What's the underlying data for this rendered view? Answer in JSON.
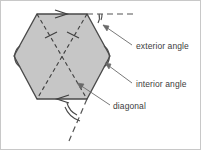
{
  "figure": {
    "shape": {
      "name": "regular hexagon",
      "sides": 6,
      "fill_color": "#c6c6c6",
      "stroke_color": "#4a4a4a",
      "vertices": [
        {
          "id": "top-left",
          "x": 37,
          "y": 14
        },
        {
          "id": "top-right",
          "x": 87,
          "y": 14
        },
        {
          "id": "right",
          "x": 110,
          "y": 56
        },
        {
          "id": "bottom-right",
          "x": 87,
          "y": 99
        },
        {
          "id": "bottom-left",
          "x": 37,
          "y": 99
        },
        {
          "id": "left",
          "x": 14,
          "y": 56
        }
      ]
    },
    "diagonals": [
      {
        "id": "diagonal-tl-br",
        "from": "top-left",
        "to": "bottom-right",
        "tick_marks": 1,
        "style": "dashed"
      },
      {
        "id": "diagonal-tr-bl",
        "from": "top-right",
        "to": "bottom-left",
        "tick_marks": 1,
        "style": "dashed"
      }
    ],
    "extension_lines": [
      {
        "id": "extension-top",
        "from": "top-right",
        "direction": "right",
        "style": "dashed"
      },
      {
        "id": "extension-bottom",
        "from": "bottom-right",
        "direction": "down-right",
        "style": "dashed"
      }
    ],
    "direction_arrows": [
      {
        "id": "arrow-top-edge",
        "edge": "top",
        "points": "right"
      },
      {
        "id": "arrow-bottom-edge",
        "edge": "bottom",
        "points": "left"
      }
    ],
    "angle_markers": [
      {
        "id": "exterior-angle-top",
        "vertex": "top-right",
        "arcs": 2,
        "type": "exterior"
      },
      {
        "id": "exterior-angle-bottom",
        "vertex": "bottom-right",
        "arcs": 2,
        "type": "exterior"
      },
      {
        "id": "interior-angle-right",
        "vertex": "right",
        "arcs": 1,
        "type": "interior"
      },
      {
        "id": "interior-angle-left",
        "vertex": "left",
        "arcs": 1,
        "type": "interior"
      }
    ],
    "labels": [
      {
        "id": "exterior-angle-label",
        "text": "exterior angle",
        "x": 135,
        "y": 48
      },
      {
        "id": "interior-angle-label",
        "text": "interior angle",
        "x": 135,
        "y": 86
      },
      {
        "id": "diagonal-label",
        "text": "diagonal",
        "x": 112,
        "y": 108
      }
    ],
    "leader_lines": [
      {
        "id": "leader-exterior",
        "from_label": "exterior-angle-label",
        "to_vertex": "top-right"
      },
      {
        "id": "leader-interior",
        "from_label": "interior-angle-label",
        "to_vertex": "right"
      },
      {
        "id": "leader-diagonal",
        "from_label": "diagonal-label",
        "to_target": "diagonal-tr-bl"
      }
    ],
    "colors": {
      "fill": "#c6c6c6",
      "outline": "#4a4a4a",
      "dashed": "#555555",
      "text": "#3c3c3c",
      "frame": "#c8c8c8",
      "background": "#ffffff"
    }
  }
}
